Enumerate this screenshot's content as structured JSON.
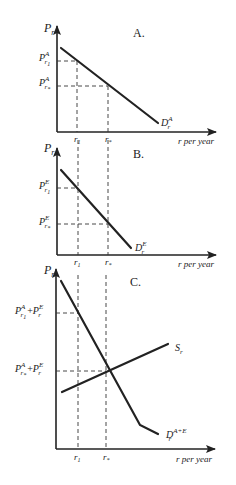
{
  "panels": [
    {
      "id": "A",
      "title": "A.",
      "y_axis_label": "P",
      "y_axis_sub": "r",
      "x_axis_label": "r per year",
      "x_ticks": [
        {
          "main": "r",
          "sub": "1"
        },
        {
          "main": "r",
          "sub": "*"
        }
      ],
      "y_ticks": [
        {
          "main": "P",
          "sup": "A",
          "sub": "r",
          "subsub": "1"
        },
        {
          "main": "P",
          "sup": "A",
          "sub": "r",
          "subsub": "*"
        }
      ],
      "curves": [
        {
          "label_main": "D",
          "label_sup": "A",
          "label_sub": "r"
        }
      ]
    },
    {
      "id": "B",
      "title": "B.",
      "y_axis_label": "P",
      "y_axis_sub": "r",
      "x_axis_label": "r per year",
      "x_ticks": [
        {
          "main": "r",
          "sub": "1"
        },
        {
          "main": "r",
          "sub": "*"
        }
      ],
      "y_ticks": [
        {
          "main": "P",
          "sup": "E",
          "sub": "r",
          "subsub": "1"
        },
        {
          "main": "P",
          "sup": "E",
          "sub": "r",
          "subsub": "*"
        }
      ],
      "curves": [
        {
          "label_main": "D",
          "label_sup": "E",
          "label_sub": "r"
        }
      ]
    },
    {
      "id": "C",
      "title": "C.",
      "y_axis_label": "P",
      "y_axis_sub": "r",
      "x_axis_label": "r per year",
      "x_ticks": [
        {
          "main": "r",
          "sub": "1"
        },
        {
          "main": "r",
          "sub": "*"
        }
      ],
      "y_ticks": [
        {
          "text": "P^A_{r1} + P^E_r",
          "a_main": "P",
          "a_sup": "A",
          "a_sub": "r",
          "a_subsub": "1",
          "plus": "+",
          "b_main": "P",
          "b_sup": "E",
          "b_sub": "r"
        },
        {
          "text": "P^A_{r*} + P^E_r",
          "a_main": "P",
          "a_sup": "A",
          "a_sub": "r",
          "a_subsub": "*",
          "plus": "+",
          "b_main": "P",
          "b_sup": "E",
          "b_sub": "r"
        }
      ],
      "curves": [
        {
          "label_main": "S",
          "label_sub": "r"
        },
        {
          "label_main": "D",
          "label_sup": "A+E",
          "label_sub": "r"
        }
      ]
    }
  ]
}
